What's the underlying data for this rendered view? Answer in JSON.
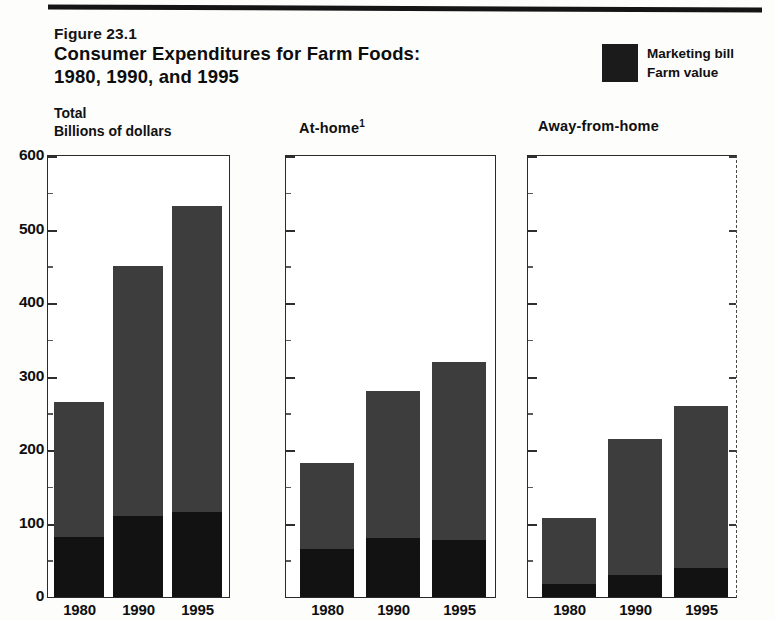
{
  "figure": {
    "number": "Figure 23.1",
    "title_line1": "Consumer Expenditures for Farm Foods:",
    "title_line2": "1980, 1990, and 1995"
  },
  "legend": {
    "swatch_color": "#1b1b1b",
    "items": [
      {
        "label": "Marketing bill",
        "color": "#3d3d3d"
      },
      {
        "label": "Farm value",
        "color": "#121212"
      }
    ]
  },
  "axis": {
    "unit_line1": "Total",
    "unit_line2": "Billions of dollars",
    "ticks": [
      "600",
      "500",
      "400",
      "300",
      "200",
      "100",
      "0"
    ]
  },
  "panels": [
    {
      "title": "At-home",
      "footnote_marker": ""
    },
    {
      "title": "Away-from-home",
      "footnote_marker": ""
    }
  ],
  "chart_data": {
    "type": "bar",
    "title": "Consumer Expenditures for Farm Foods: 1980, 1990, and 1995",
    "subtitle": "Figure 23.1",
    "stacked": true,
    "xlabel": "",
    "ylabel": "Billions of dollars",
    "ylim": [
      0,
      600
    ],
    "yticks": [
      0,
      100,
      200,
      300,
      400,
      500,
      600
    ],
    "grid": false,
    "legend_position": "top-right",
    "categories": [
      "1980",
      "1990",
      "1995"
    ],
    "panels": [
      {
        "name": "Total",
        "label": "Total",
        "series": [
          {
            "name": "Farm value",
            "color": "#121212",
            "values": [
              82,
              110,
              116
            ]
          },
          {
            "name": "Marketing bill",
            "color": "#3d3d3d",
            "values": [
              183,
              340,
              416
            ]
          }
        ],
        "totals": [
          265,
          450,
          532
        ]
      },
      {
        "name": "At-home",
        "label": "At-home",
        "footnote": "1",
        "series": [
          {
            "name": "Farm value",
            "color": "#121212",
            "values": [
              65,
              80,
              78
            ]
          },
          {
            "name": "Marketing bill",
            "color": "#3d3d3d",
            "values": [
              117,
              200,
              242
            ]
          }
        ],
        "totals": [
          182,
          280,
          320
        ]
      },
      {
        "name": "Away-from-home",
        "label": "Away-from-home",
        "series": [
          {
            "name": "Farm value",
            "color": "#121212",
            "values": [
              18,
              30,
              40
            ]
          },
          {
            "name": "Marketing bill",
            "color": "#3d3d3d",
            "values": [
              89,
              185,
              220
            ]
          }
        ],
        "totals": [
          107,
          215,
          260
        ]
      }
    ]
  }
}
